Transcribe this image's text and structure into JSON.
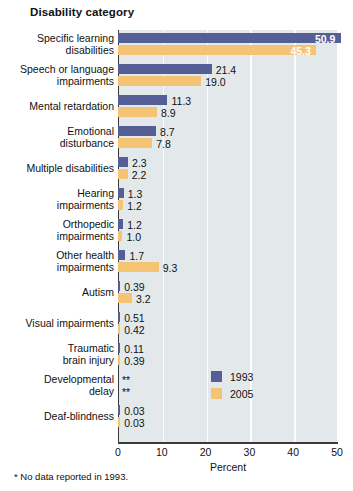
{
  "chart_data": {
    "type": "bar",
    "orientation": "horizontal",
    "title": "Disability category",
    "xlabel": "Percent",
    "ylabel": "Disability category",
    "xlim": [
      0,
      50
    ],
    "xticks": [
      0,
      10,
      20,
      30,
      40,
      50
    ],
    "grid": true,
    "legend_position": "middle-right",
    "footnote": "* No data reported in 1993.",
    "categories": [
      "Specific learning disabilities",
      "Speech or language impairments",
      "Mental retardation",
      "Emotional disturbance",
      "Multiple disabilities",
      "Hearing impairments",
      "Orthopedic impairments",
      "Other health impairments",
      "Autism",
      "Visual impairments",
      "Traumatic brain injury",
      "Developmental delay",
      "Deaf-blindness"
    ],
    "series": [
      {
        "name": "1993",
        "color": "#565e96",
        "values": [
          50.9,
          21.4,
          11.3,
          8.7,
          2.3,
          1.3,
          1.2,
          1.7,
          0.39,
          0.51,
          0.11,
          null,
          0.03
        ],
        "labels": [
          "50.9",
          "21.4",
          "11.3",
          "8.7",
          "2.3",
          "1.3",
          "1.2",
          "1.7",
          "0.39",
          "0.51",
          "0.11",
          "**",
          "0.03"
        ]
      },
      {
        "name": "2005",
        "color": "#f5c374",
        "values": [
          45.3,
          19.0,
          8.9,
          7.8,
          2.2,
          1.2,
          1.0,
          9.3,
          3.2,
          0.42,
          0.39,
          null,
          0.03
        ],
        "labels": [
          "45.3",
          "19.0",
          "8.9",
          "7.8",
          "2.2",
          "1.2",
          "1.0",
          "9.3",
          "3.2",
          "0.42",
          "0.39",
          "**",
          "0.03"
        ]
      }
    ]
  },
  "category_lines": [
    [
      "Specific learning",
      "disabilities"
    ],
    [
      "Speech or language",
      "impairments"
    ],
    [
      "Mental retardation"
    ],
    [
      "Emotional",
      "disturbance"
    ],
    [
      "Multiple disabilities"
    ],
    [
      "Hearing",
      "impairments"
    ],
    [
      "Orthopedic",
      "impairments"
    ],
    [
      "Other health",
      "impairments"
    ],
    [
      "Autism"
    ],
    [
      "Visual impairments"
    ],
    [
      "Traumatic",
      "brain injury"
    ],
    [
      "Developmental",
      "delay"
    ],
    [
      "Deaf-blindness"
    ]
  ],
  "colors": {
    "series_1993": "#565e96",
    "series_2005": "#f5c374",
    "plot_background": "#e3e9eb",
    "gridline": "#fbfcfc",
    "axis": "#3a3a3a",
    "text": "#111111"
  }
}
